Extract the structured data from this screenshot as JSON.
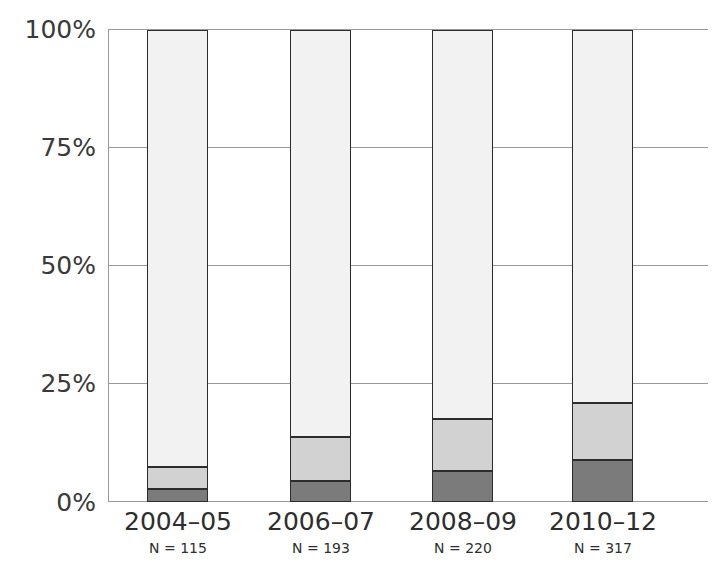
{
  "chart_data": {
    "type": "bar",
    "subtype": "stacked-100-percent",
    "title": "",
    "subtitle": "",
    "xlabel": "",
    "ylabel": "",
    "categories": [
      "2004–05",
      "2006–07",
      "2008–09",
      "2010–12"
    ],
    "sample_sizes": [
      "N = 115",
      "N = 193",
      "N = 220",
      "N = 317"
    ],
    "sample_size_values": [
      115,
      193,
      220,
      317
    ],
    "ylim": [
      0,
      100
    ],
    "ytick_labels": [
      "0%",
      "25%",
      "50%",
      "75%",
      "100%"
    ],
    "ytick_values": [
      0,
      25,
      50,
      75,
      100
    ],
    "grid": true,
    "grid_axis": "y",
    "legend": "none",
    "series": [
      {
        "name": "bottom-segment",
        "color": "#7b7b7b",
        "values": [
          2.7,
          4.5,
          6.5,
          9.0
        ]
      },
      {
        "name": "middle-segment",
        "color": "#d2d2d2",
        "values": [
          4.8,
          9.3,
          11.0,
          12.0
        ]
      },
      {
        "name": "top-segment",
        "color": "#f2f2f2",
        "values": [
          92.5,
          86.2,
          82.5,
          79.0
        ]
      }
    ],
    "cumulative_tops": [
      [
        2.7,
        7.5,
        100.0
      ],
      [
        4.5,
        13.8,
        100.0
      ],
      [
        6.5,
        17.5,
        100.0
      ],
      [
        9.0,
        21.0,
        100.0
      ]
    ],
    "colors": {
      "segment_dark": "#7b7b7b",
      "segment_medium": "#d2d2d2",
      "segment_light": "#f2f2f2",
      "bar_outline": "#2c2c2c",
      "gridline": "#9a9a9a",
      "text": "#2e2e2e",
      "background": "#ffffff"
    }
  }
}
